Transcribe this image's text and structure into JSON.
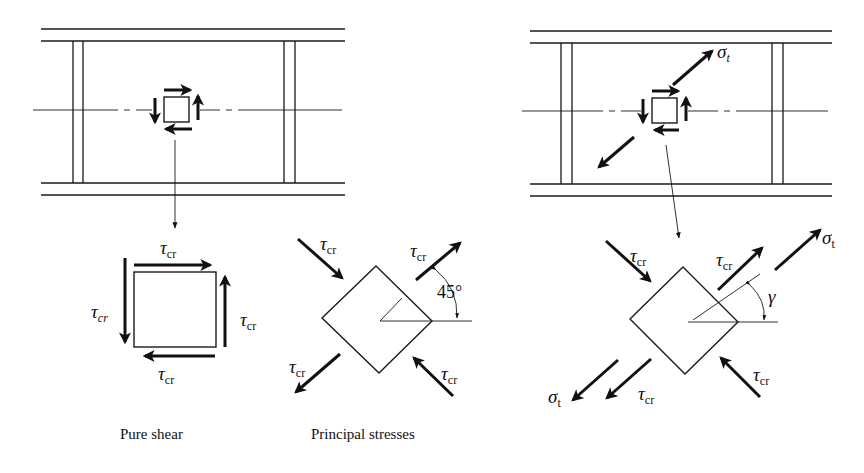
{
  "figure": {
    "colors": {
      "ink": "#111111",
      "background": "#ffffff"
    },
    "left_girder": {
      "label": "plate girder panel with web element in pure shear",
      "element_arrows": [
        "shear-top-right",
        "shear-right-up",
        "shear-bottom-left",
        "shear-left-down"
      ]
    },
    "right_girder": {
      "label": "plate girder panel with tension field",
      "tension_symbol": "σ",
      "tension_subscript": "t"
    },
    "pure_shear": {
      "caption": "Pure shear",
      "tau": "τ",
      "tau_sub_upright": "cr",
      "tau_sub_italic": "cr"
    },
    "principal_stresses": {
      "caption": "Principal stresses",
      "tau": "τ",
      "tau_sub": "cr",
      "angle_label": "45°"
    },
    "tension_field": {
      "tau": "τ",
      "tau_sub": "cr",
      "sigma": "σ",
      "sigma_sub": "t",
      "angle_symbol": "γ"
    }
  }
}
